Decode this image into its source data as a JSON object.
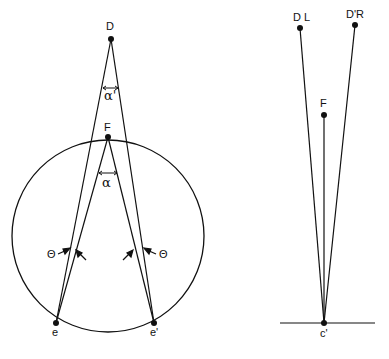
{
  "left_diagram": {
    "labels": {
      "D": "D",
      "F": "F",
      "e": "e",
      "e_prime": "e'",
      "alpha_prime": "α'",
      "alpha": "α",
      "theta_left": "Θ",
      "theta_right": "Θ"
    },
    "points": {
      "D": [
        111,
        39
      ],
      "F": [
        108,
        137
      ],
      "e": [
        56,
        323
      ],
      "e_prime": [
        154,
        323
      ]
    },
    "circle": {
      "cx": 108,
      "cy": 236,
      "r": 96
    }
  },
  "right_diagram": {
    "labels": {
      "DL": "D L",
      "DR": "D'R",
      "F": "F",
      "c_prime": "c'"
    },
    "points": {
      "DL": [
        300,
        28
      ],
      "DR": [
        355,
        25
      ],
      "F": [
        324,
        115
      ],
      "c_prime": [
        324,
        323
      ]
    },
    "baseline": {
      "x1": 280,
      "x2": 375,
      "y": 323
    }
  },
  "colors": {
    "ink": "#111111",
    "background": "#ffffff"
  }
}
